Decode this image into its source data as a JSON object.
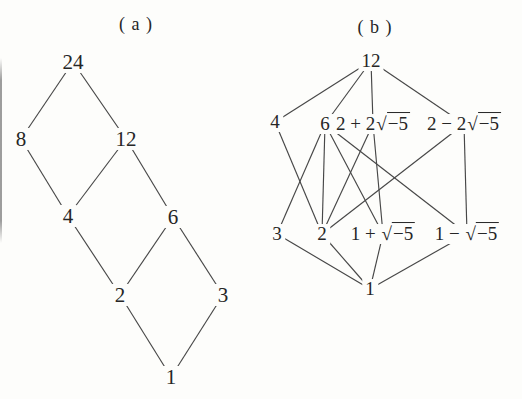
{
  "page": {
    "background": "#fdfdfb",
    "text_color": "#262626",
    "line_color": "#474747",
    "figure_type": "hasse-lattice-diagrams"
  },
  "figures": [
    {
      "id": "a",
      "title": "( a )",
      "description": "divisor lattice of 24",
      "nodes": [
        {
          "id": "24",
          "label": "24",
          "x": 73,
          "y": 62
        },
        {
          "id": "8",
          "label": "8",
          "x": 21,
          "y": 139
        },
        {
          "id": "12",
          "label": "12",
          "x": 126,
          "y": 139
        },
        {
          "id": "4",
          "label": "4",
          "x": 68,
          "y": 216
        },
        {
          "id": "6",
          "label": "6",
          "x": 173,
          "y": 217
        },
        {
          "id": "2",
          "label": "2",
          "x": 120,
          "y": 295
        },
        {
          "id": "3",
          "label": "3",
          "x": 223,
          "y": 295
        },
        {
          "id": "1",
          "label": "1",
          "x": 171,
          "y": 377
        }
      ],
      "edges": [
        [
          "24",
          "8"
        ],
        [
          "24",
          "12"
        ],
        [
          "8",
          "4"
        ],
        [
          "12",
          "4"
        ],
        [
          "12",
          "6"
        ],
        [
          "4",
          "2"
        ],
        [
          "6",
          "2"
        ],
        [
          "6",
          "3"
        ],
        [
          "2",
          "1"
        ],
        [
          "3",
          "1"
        ]
      ]
    },
    {
      "id": "b",
      "title": "( b )",
      "description": "divisibility diagram of 12 in Z[sqrt(-5)]",
      "nodes": [
        {
          "id": "12",
          "label": "12",
          "x": 371,
          "y": 61
        },
        {
          "id": "4",
          "label": "4",
          "x": 275,
          "y": 122
        },
        {
          "id": "6",
          "label": "6",
          "x": 325,
          "y": 124
        },
        {
          "id": "2p2r",
          "label": "2 + 2",
          "radicand": "−5",
          "x": 373,
          "y": 124
        },
        {
          "id": "2m2r",
          "label": "2 − 2",
          "radicand": "−5",
          "x": 464,
          "y": 124
        },
        {
          "id": "3",
          "label": "3",
          "x": 277,
          "y": 234
        },
        {
          "id": "2",
          "label": "2",
          "x": 322,
          "y": 234
        },
        {
          "id": "1pr",
          "label": "1 + ",
          "radicand": "−5",
          "x": 383,
          "y": 234
        },
        {
          "id": "1mr",
          "label": "1 − ",
          "radicand": "−5",
          "x": 467,
          "y": 234
        },
        {
          "id": "1",
          "label": "1",
          "x": 370,
          "y": 289
        }
      ],
      "edges": [
        [
          "12",
          "4"
        ],
        [
          "12",
          "6"
        ],
        [
          "12",
          "2p2r"
        ],
        [
          "12",
          "2m2r"
        ],
        [
          "4",
          "2"
        ],
        [
          "6",
          "3"
        ],
        [
          "6",
          "2"
        ],
        [
          "6",
          "1pr"
        ],
        [
          "6",
          "1mr"
        ],
        [
          "2p2r",
          "2"
        ],
        [
          "2p2r",
          "1pr"
        ],
        [
          "2m2r",
          "2"
        ],
        [
          "2m2r",
          "1mr"
        ],
        [
          "3",
          "1"
        ],
        [
          "2",
          "1"
        ],
        [
          "1pr",
          "1"
        ],
        [
          "1mr",
          "1"
        ]
      ]
    }
  ]
}
